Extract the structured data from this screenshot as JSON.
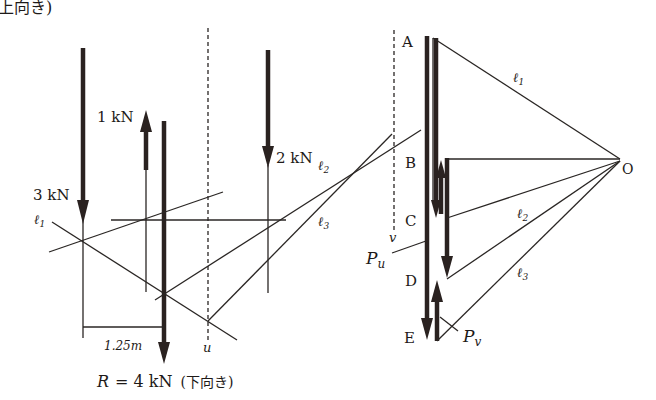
{
  "figure": {
    "top_caption_fragment": "上向き)",
    "colors": {
      "ink": "#2a2220",
      "background": "#ffffff"
    }
  },
  "space_diagram": {
    "forces": [
      {
        "label": "3 kN",
        "direction": "down"
      },
      {
        "label": "1 kN",
        "direction": "up"
      },
      {
        "label": "2 kN",
        "direction": "down"
      }
    ],
    "resultant": {
      "label": "R = 4 kN (下向き)",
      "symbol": "R",
      "value": "= 4 kN",
      "note": "(下向き)",
      "direction": "down"
    },
    "funicular_lines": [
      "ℓ1",
      "ℓ2",
      "ℓ3"
    ],
    "labels": {
      "l1": "ℓ",
      "l1_sub": "1",
      "l2": "ℓ",
      "l2_sub": "2",
      "l3": "ℓ",
      "l3_sub": "3"
    },
    "dimension": "1.25m",
    "dashed_line_label": "u"
  },
  "force_polygon": {
    "points": [
      "A",
      "B",
      "C",
      "D",
      "E"
    ],
    "pole": "O",
    "rays": {
      "l1": "ℓ",
      "l1_sub": "1",
      "l2": "ℓ",
      "l2_sub": "2",
      "l3": "ℓ",
      "l3_sub": "3"
    },
    "reactions": {
      "Pu": "P",
      "Pu_sub": "u",
      "Pv": "P",
      "Pv_sub": "v"
    },
    "dashed_line_label": "v"
  }
}
